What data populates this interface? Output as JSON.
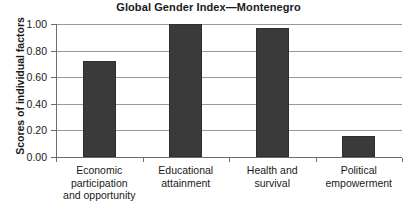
{
  "chart_data": {
    "type": "bar",
    "title": "Global Gender Index—Montenegro",
    "xlabel": "",
    "ylabel": "Scores of individual factors",
    "categories": [
      "Economic participation and opportunity",
      "Educational attainment",
      "Health and survival",
      "Political empowerment"
    ],
    "category_lines": [
      [
        "Economic",
        "participation",
        "and opportunity"
      ],
      [
        "Educational",
        "attainment"
      ],
      [
        "Health and",
        "survival"
      ],
      [
        "Political",
        "empowerment"
      ]
    ],
    "values": [
      0.72,
      1.0,
      0.97,
      0.16
    ],
    "ylim": [
      0.0,
      1.0
    ],
    "yticks": [
      0.0,
      0.2,
      0.4,
      0.6,
      0.8,
      1.0
    ],
    "ytick_labels": [
      "0.00",
      "0.20",
      "0.40",
      "0.60",
      "0.80",
      "1.00"
    ],
    "grid": true,
    "legend": false,
    "bar_color": "#3a3a3a",
    "grid_color": "#9a9a9a",
    "axis_color": "#6d6d6d",
    "background_color": "#ffffff"
  }
}
